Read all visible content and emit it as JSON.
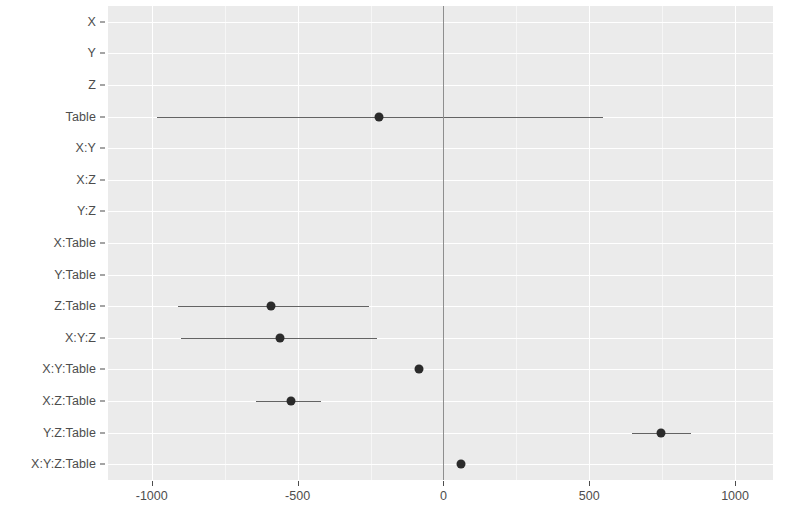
{
  "chart_data": {
    "type": "scatter",
    "subtype": "coefficient-forest-plot",
    "title": "",
    "subtitle": "",
    "xlabel": "",
    "ylabel": "",
    "xlim": [
      -1150,
      1130
    ],
    "ylim_categories_order": "top-to-bottom",
    "grid": true,
    "legend": null,
    "zero_reference_line": 0,
    "x_ticks": [
      -1000,
      -500,
      0,
      500,
      1000
    ],
    "x_tick_labels": [
      "-1000",
      "-500",
      "0",
      "500",
      "1000"
    ],
    "x_minor_ticks": [
      -750,
      -250,
      250,
      750
    ],
    "categories": [
      "X",
      "Y",
      "Z",
      "Table",
      "X:Y",
      "X:Z",
      "Y:Z",
      "X:Table",
      "Y:Table",
      "Z:Table",
      "X:Y:Z",
      "X:Y:Table",
      "X:Z:Table",
      "Y:Z:Table",
      "X:Y:Z:Table"
    ],
    "points": [
      {
        "category": "X",
        "estimate": null,
        "low": null,
        "high": null,
        "visible": false
      },
      {
        "category": "Y",
        "estimate": null,
        "low": null,
        "high": null,
        "visible": false
      },
      {
        "category": "Z",
        "estimate": null,
        "low": null,
        "high": null,
        "visible": false
      },
      {
        "category": "Table",
        "estimate": -221,
        "low": -983,
        "high": 548,
        "visible": true
      },
      {
        "category": "X:Y",
        "estimate": null,
        "low": null,
        "high": null,
        "visible": false
      },
      {
        "category": "X:Z",
        "estimate": null,
        "low": null,
        "high": null,
        "visible": false
      },
      {
        "category": "Y:Z",
        "estimate": null,
        "low": null,
        "high": null,
        "visible": false
      },
      {
        "category": "X:Table",
        "estimate": null,
        "low": null,
        "high": null,
        "visible": false
      },
      {
        "category": "Y:Table",
        "estimate": null,
        "low": null,
        "high": null,
        "visible": false
      },
      {
        "category": "Z:Table",
        "estimate": -590,
        "low": -910,
        "high": -255,
        "visible": true
      },
      {
        "category": "X:Y:Z",
        "estimate": -559,
        "low": -900,
        "high": -228,
        "visible": true
      },
      {
        "category": "X:Y:Table",
        "estimate": -83,
        "low": -97,
        "high": -69,
        "visible": true
      },
      {
        "category": "X:Z:Table",
        "estimate": -524,
        "low": -641,
        "high": -421,
        "visible": true
      },
      {
        "category": "Y:Z:Table",
        "estimate": 745,
        "low": 648,
        "high": 848,
        "visible": true
      },
      {
        "category": "X:Y:Z:Table",
        "estimate": 59,
        "low": 52,
        "high": 66,
        "visible": true
      }
    ],
    "colors": {
      "panel_background": "#ebebeb",
      "grid_major": "#ffffff",
      "grid_minor": "#f6f6f6",
      "point": "#2b2b2b",
      "errorbar": "#636363",
      "zero_line": "#8e8e8e",
      "axis_text": "#4d4d4d",
      "figure_background": "#ffffff"
    }
  }
}
